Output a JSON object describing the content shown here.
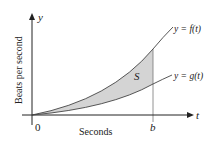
{
  "diagram": {
    "y_axis_label": "Beats per second",
    "y_axis_var": "y",
    "x_axis_label": "Seconds",
    "x_axis_var": "t",
    "origin_label": "0",
    "b_label": "b",
    "region_label": "S",
    "curve_f_label": "y = f(t)",
    "curve_g_label": "y = g(t)",
    "colors": {
      "axis": "#222222",
      "curve": "#444444",
      "fill": "#d4d4d4"
    }
  }
}
